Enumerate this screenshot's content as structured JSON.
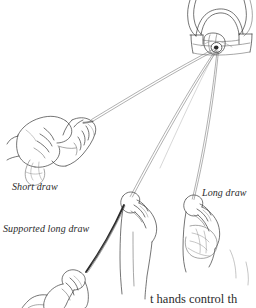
{
  "figure": {
    "background_color": "#ffffff",
    "ink_color": "#3a3a3a",
    "yarn_color": "#6e6e6e",
    "yarn_dark_color": "#2a2a2a"
  },
  "labels": {
    "short_draw": "Short draw",
    "long_draw": "Long draw",
    "supported_long_draw": "Supported long draw"
  },
  "caption": {
    "text": "t hands control th"
  },
  "parts": {
    "orifice": "flyer-orifice",
    "wheel": "spinning-wheel-flyer",
    "hand_short_draw": "short-draw-hands",
    "hand_long_draw": "long-draw-hand",
    "hand_middle": "supported-long-draw-upper-hand",
    "hand_lower": "supported-long-draw-lower-hand",
    "fiber": "fiber-supply"
  }
}
